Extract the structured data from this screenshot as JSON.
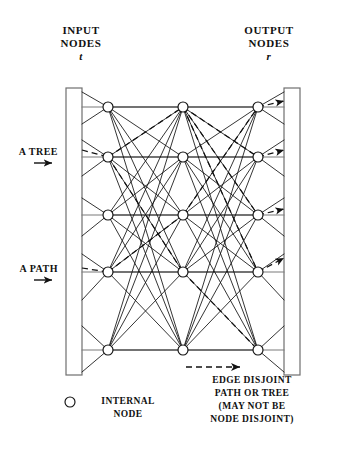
{
  "figure": {
    "kind": "interconnection-network-diagram",
    "width": 342,
    "height": 460,
    "background": "#ffffff",
    "ink": "#111111"
  },
  "header": {
    "input": {
      "line1": "INPUT",
      "line2": "NODES",
      "symbol": "t"
    },
    "output": {
      "line1": "OUTPUT",
      "line2": "NODES",
      "symbol": "r"
    }
  },
  "annotations": {
    "tree": {
      "label": "A TREE",
      "arrow": "right-arrow-icon"
    },
    "path": {
      "label": "A PATH",
      "arrow": "right-arrow-icon"
    }
  },
  "legend": {
    "internal_node": {
      "symbol": "circle-icon",
      "line1": "INTERNAL",
      "line2": "NODE"
    },
    "edge_disjoint": {
      "symbol": "dashed-arrow-icon",
      "line1": "EDGE DISJOINT",
      "line2": "PATH OR TREE",
      "line3": "(MAY NOT BE",
      "line4": "NODE DISJOINT)"
    }
  },
  "graph": {
    "columns_x": [
      108,
      183,
      258
    ],
    "rows_y": [
      107,
      157,
      215,
      272,
      350
    ],
    "node_radius": 5,
    "node_count": 15,
    "input_rail": {
      "x1": 66,
      "x2": 82,
      "y1": 88,
      "y2": 375
    },
    "output_rail": {
      "x1": 284,
      "x2": 300,
      "y1": 88,
      "y2": 375
    },
    "rail_stub_rows_y": [
      107,
      131,
      157,
      185,
      215,
      243,
      272,
      310,
      350
    ],
    "solid_edge_color": "#111111",
    "dashed_edge_color": "#111111"
  }
}
